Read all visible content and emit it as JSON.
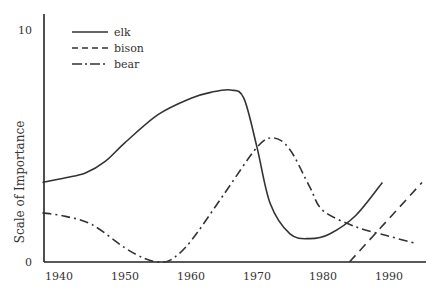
{
  "chart_data": {
    "type": "line",
    "title": "",
    "xlabel": "",
    "ylabel": "Scale of Importance",
    "xlim": [
      1937.5,
      1996
    ],
    "ylim": [
      0,
      10
    ],
    "x_ticks": [
      1940,
      1950,
      1960,
      1970,
      1980,
      1990
    ],
    "y_ticks": [
      0,
      10
    ],
    "grid": false,
    "legend_position": "upper-left",
    "series": [
      {
        "name": "elk",
        "style": "solid",
        "x": [
          1937.5,
          1941,
          1944,
          1947,
          1950,
          1955,
          1960,
          1963,
          1966,
          1968,
          1970,
          1972,
          1975,
          1978,
          1981,
          1985,
          1989
        ],
        "y": [
          3.4,
          3.6,
          3.8,
          4.3,
          5.1,
          6.3,
          7.0,
          7.25,
          7.35,
          7.0,
          4.9,
          2.5,
          1.2,
          1.0,
          1.2,
          2.0,
          3.4
        ]
      },
      {
        "name": "bison",
        "style": "dashed",
        "x": [
          1984,
          1995
        ],
        "y": [
          0,
          3.4
        ]
      },
      {
        "name": "bear",
        "style": "dash-dot",
        "x": [
          1937.5,
          1941,
          1945,
          1950,
          1953,
          1955,
          1957,
          1960,
          1965,
          1970,
          1972.5,
          1975,
          1978,
          1980,
          1985,
          1990,
          1994
        ],
        "y": [
          2.1,
          1.95,
          1.6,
          0.6,
          0.15,
          0.0,
          0.1,
          0.9,
          2.9,
          4.9,
          5.3,
          4.8,
          3.2,
          2.2,
          1.5,
          1.1,
          0.8
        ]
      }
    ],
    "legend": [
      "elk",
      "bison",
      "bear"
    ]
  },
  "axis": {
    "y_top_label": "10",
    "y_bottom_label": "0",
    "ylabel": "Scale of Importance",
    "x_labels": [
      "1940",
      "1950",
      "1960",
      "1970",
      "1980",
      "1990"
    ]
  },
  "legend": {
    "items": [
      {
        "label": "elk",
        "style": "solid"
      },
      {
        "label": "bison",
        "style": "dashed"
      },
      {
        "label": "bear",
        "style": "dash-dot"
      }
    ]
  }
}
